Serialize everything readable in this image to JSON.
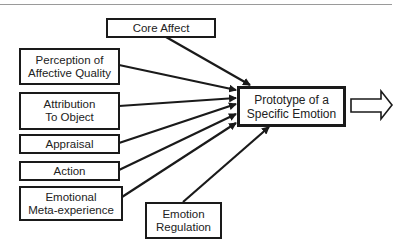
{
  "diagram": {
    "type": "flow",
    "center_node": {
      "id": "prototype",
      "label": "Prototype of a\nSpecific Emotion"
    },
    "input_nodes": [
      {
        "id": "core-affect",
        "label": "Core Affect"
      },
      {
        "id": "perception",
        "label": "Perception of\nAffective Quality"
      },
      {
        "id": "attribution",
        "label": "Attribution\nTo Object"
      },
      {
        "id": "appraisal",
        "label": "Appraisal"
      },
      {
        "id": "action",
        "label": "Action"
      },
      {
        "id": "meta-experience",
        "label": "Emotional\nMeta-experience"
      },
      {
        "id": "regulation",
        "label": "Emotion\nRegulation"
      }
    ],
    "edges": [
      {
        "from": "core-affect",
        "to": "prototype"
      },
      {
        "from": "perception",
        "to": "prototype"
      },
      {
        "from": "attribution",
        "to": "prototype"
      },
      {
        "from": "appraisal",
        "to": "prototype"
      },
      {
        "from": "action",
        "to": "prototype"
      },
      {
        "from": "meta-experience",
        "to": "prototype"
      },
      {
        "from": "regulation",
        "to": "prototype"
      }
    ],
    "output_arrow": {
      "style": "hollow",
      "direction": "right"
    },
    "colors": {
      "stroke": "#1a1a1a",
      "text": "#222222",
      "rule": "#9a9a9a"
    }
  }
}
